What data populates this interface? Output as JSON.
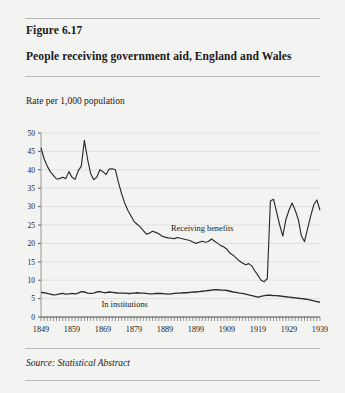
{
  "figure": {
    "number": "Figure 6.17",
    "title": "People receiving government aid, England and Wales",
    "axis_note": "Rate per 1,000 population",
    "source": "Source: Statistical Abstract"
  },
  "colors": {
    "page_background": "#f3f3f1",
    "rule": "#b7b7b5",
    "line": "#2b2b2b",
    "grid": "#d9d9d6",
    "text": "#1a1a1a"
  },
  "chart_data": {
    "type": "line",
    "title": "People receiving government aid, England and Wales",
    "subtitle": "Figure 6.17",
    "xlabel": "",
    "ylabel": "Rate per 1,000 population",
    "xlim": [
      1849,
      1939
    ],
    "ylim": [
      0,
      50
    ],
    "ytick_step": 5,
    "yticks": [
      0,
      5,
      10,
      15,
      20,
      25,
      30,
      35,
      40,
      45,
      50
    ],
    "xticks": [
      1849,
      1859,
      1869,
      1879,
      1889,
      1899,
      1909,
      1919,
      1929,
      1939
    ],
    "xtick_labels": [
      "1849",
      "1859",
      "1869",
      "1879",
      "1889",
      "1899",
      "1909",
      "1919",
      "1929",
      "1939"
    ],
    "minor_xticks": "every year",
    "grid": "horizontal",
    "legend": "inline annotations",
    "annotations": [
      {
        "text": "Receiving benefits",
        "x": 1901,
        "y": 23.5
      },
      {
        "text": "In institutions",
        "x": 1876,
        "y": 2.6
      }
    ],
    "series": [
      {
        "name": "Receiving benefits",
        "x": [
          1849,
          1850,
          1851,
          1852,
          1853,
          1854,
          1855,
          1856,
          1857,
          1858,
          1859,
          1860,
          1861,
          1862,
          1863,
          1864,
          1865,
          1866,
          1867,
          1868,
          1869,
          1870,
          1871,
          1872,
          1873,
          1874,
          1875,
          1876,
          1877,
          1878,
          1879,
          1880,
          1881,
          1882,
          1883,
          1884,
          1885,
          1886,
          1887,
          1888,
          1889,
          1890,
          1891,
          1892,
          1893,
          1894,
          1895,
          1896,
          1897,
          1898,
          1899,
          1900,
          1901,
          1902,
          1903,
          1904,
          1905,
          1906,
          1907,
          1908,
          1909,
          1910,
          1911,
          1912,
          1913,
          1914,
          1915,
          1916,
          1917,
          1918,
          1919,
          1920,
          1921,
          1922,
          1923,
          1924,
          1925,
          1926,
          1927,
          1928,
          1929,
          1930,
          1931,
          1932,
          1933,
          1934,
          1935,
          1936,
          1937,
          1938,
          1939
        ],
        "y": [
          46.0,
          43.0,
          41.0,
          39.5,
          38.5,
          37.5,
          37.6,
          38.0,
          37.6,
          39.5,
          38.0,
          37.4,
          39.7,
          41.0,
          48.0,
          43.0,
          39.0,
          37.3,
          38.0,
          40.0,
          39.5,
          38.7,
          40.2,
          40.3,
          40.0,
          36.5,
          33.5,
          31.0,
          29.0,
          27.5,
          26.0,
          25.2,
          24.5,
          23.5,
          22.5,
          22.8,
          23.3,
          23.0,
          22.6,
          22.0,
          21.7,
          21.5,
          21.4,
          21.3,
          21.6,
          21.4,
          21.2,
          21.0,
          20.8,
          20.4,
          20.0,
          20.3,
          20.6,
          20.3,
          20.5,
          21.2,
          20.6,
          20.0,
          19.4,
          19.0,
          18.4,
          17.3,
          16.8,
          16.0,
          15.2,
          14.7,
          14.2,
          14.5,
          13.9,
          12.5,
          11.3,
          10.0,
          9.6,
          10.4,
          31.5,
          32.0,
          28.5,
          25.0,
          22.0,
          26.5,
          29.0,
          31.0,
          29.0,
          26.5,
          22.0,
          20.5,
          24.0,
          27.5,
          30.5,
          31.8,
          29.0
        ]
      },
      {
        "name": "In institutions",
        "x": [
          1849,
          1850,
          1851,
          1852,
          1853,
          1854,
          1855,
          1856,
          1857,
          1858,
          1859,
          1860,
          1861,
          1862,
          1863,
          1864,
          1865,
          1866,
          1867,
          1868,
          1869,
          1870,
          1871,
          1872,
          1873,
          1874,
          1875,
          1876,
          1877,
          1878,
          1879,
          1880,
          1881,
          1882,
          1883,
          1884,
          1885,
          1886,
          1887,
          1888,
          1889,
          1890,
          1891,
          1892,
          1893,
          1894,
          1895,
          1896,
          1897,
          1898,
          1899,
          1900,
          1901,
          1902,
          1903,
          1904,
          1905,
          1906,
          1907,
          1908,
          1909,
          1910,
          1911,
          1912,
          1913,
          1914,
          1915,
          1916,
          1917,
          1918,
          1919,
          1920,
          1921,
          1922,
          1923,
          1924,
          1925,
          1926,
          1927,
          1928,
          1929,
          1930,
          1931,
          1932,
          1933,
          1934,
          1935,
          1936,
          1937,
          1938,
          1939
        ],
        "y": [
          6.7,
          6.6,
          6.4,
          6.2,
          6.0,
          6.1,
          6.3,
          6.4,
          6.2,
          6.3,
          6.4,
          6.3,
          6.5,
          6.9,
          6.8,
          6.5,
          6.4,
          6.5,
          6.8,
          6.9,
          6.7,
          6.6,
          6.8,
          6.7,
          6.6,
          6.5,
          6.5,
          6.5,
          6.4,
          6.4,
          6.5,
          6.6,
          6.5,
          6.5,
          6.4,
          6.3,
          6.3,
          6.4,
          6.4,
          6.4,
          6.3,
          6.2,
          6.3,
          6.4,
          6.5,
          6.5,
          6.6,
          6.6,
          6.7,
          6.8,
          6.8,
          6.9,
          7.0,
          7.1,
          7.2,
          7.3,
          7.4,
          7.4,
          7.3,
          7.3,
          7.2,
          7.0,
          6.8,
          6.7,
          6.5,
          6.4,
          6.2,
          6.0,
          5.8,
          5.6,
          5.4,
          5.6,
          5.8,
          5.9,
          5.9,
          5.8,
          5.8,
          5.7,
          5.6,
          5.5,
          5.4,
          5.3,
          5.2,
          5.1,
          5.0,
          4.9,
          4.8,
          4.6,
          4.4,
          4.2,
          4.0
        ]
      }
    ]
  }
}
